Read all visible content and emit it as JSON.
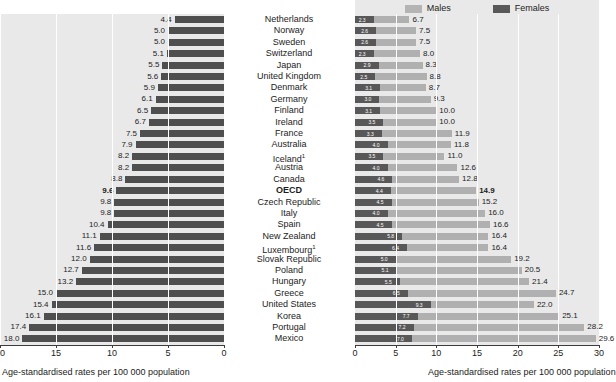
{
  "legend": {
    "items": [
      {
        "label": "Males",
        "color": "#b0b0b0",
        "name": "males"
      },
      {
        "label": "Females",
        "color": "#585858",
        "name": "females"
      }
    ]
  },
  "axis_title_left": "Age-standardised rates per 100 000 population",
  "axis_title_right": "Age-standardised rates per 100 000 population",
  "left_ticks": [
    "20",
    "15",
    "10",
    "5",
    "0"
  ],
  "right_ticks": [
    "0",
    "5",
    "10",
    "15",
    "20",
    "25",
    "30"
  ],
  "chart_data": {
    "type": "bar",
    "title": "",
    "subtitle": "",
    "orientation": "horizontal",
    "panels": [
      {
        "name": "total",
        "xlabel": "Age-standardised rates per 100 000 population",
        "xlim": [
          20,
          0
        ],
        "direction": "right-to-left",
        "ticks": [
          20,
          15,
          10,
          5,
          0
        ],
        "grid": true,
        "series_name": "Total",
        "color": "#4f4f4f"
      },
      {
        "name": "by-sex",
        "xlabel": "Age-standardised rates per 100 000 population",
        "xlim": [
          0,
          30
        ],
        "direction": "left-to-right",
        "ticks": [
          0,
          5,
          10,
          15,
          20,
          25,
          30
        ],
        "grid": true,
        "legend": [
          "Males",
          "Females"
        ],
        "legend_position": "top"
      }
    ],
    "categories": [
      "Netherlands",
      "Norway",
      "Sweden",
      "Switzerland",
      "Japan",
      "United Kingdom",
      "Denmark",
      "Germany",
      "Finland",
      "Ireland",
      "France",
      "Australia",
      "Iceland¹",
      "Austria",
      "Canada",
      "OECD",
      "Czech Republic",
      "Italy",
      "Spain",
      "New Zealand",
      "Luxembourg¹",
      "Slovak Republic",
      "Poland",
      "Hungary",
      "Greece",
      "United States",
      "Korea",
      "Portugal",
      "Mexico"
    ],
    "series": [
      {
        "name": "Total",
        "panel": "total",
        "values": [
          4.4,
          5.0,
          5.0,
          5.1,
          5.5,
          5.6,
          5.9,
          6.1,
          6.5,
          6.7,
          7.5,
          7.9,
          8.2,
          8.2,
          8.8,
          9.6,
          9.8,
          9.8,
          10.4,
          11.1,
          11.6,
          12.0,
          12.7,
          13.2,
          15.0,
          15.4,
          16.1,
          17.4,
          18.0
        ]
      },
      {
        "name": "Males",
        "panel": "by-sex",
        "values": [
          6.7,
          7.5,
          7.5,
          8.0,
          8.3,
          8.8,
          8.7,
          9.3,
          10.0,
          10.0,
          11.9,
          11.8,
          11.0,
          12.6,
          12.8,
          14.9,
          15.2,
          16.0,
          16.6,
          16.4,
          16.4,
          19.2,
          20.5,
          21.4,
          24.7,
          22.0,
          25.1,
          28.2,
          29.6
        ]
      },
      {
        "name": "Females",
        "panel": "by-sex",
        "values": [
          2.3,
          2.6,
          2.6,
          2.3,
          2.9,
          2.5,
          3.1,
          3.0,
          3.1,
          3.5,
          3.3,
          4.0,
          3.5,
          4.0,
          4.6,
          4.4,
          4.5,
          4.0,
          4.5,
          5.8,
          6.4,
          5.0,
          5.1,
          5.5,
          6.5,
          9.3,
          7.7,
          7.2,
          7.0
        ]
      }
    ],
    "rows": [
      {
        "country": "Netherlands",
        "total": "4.4",
        "males": "6.7",
        "females": "2.3",
        "bold": false
      },
      {
        "country": "Norway",
        "total": "5.0",
        "males": "7.5",
        "females": "2.6",
        "bold": false
      },
      {
        "country": "Sweden",
        "total": "5.0",
        "males": "7.5",
        "females": "2.6",
        "bold": false
      },
      {
        "country": "Switzerland",
        "total": "5.1",
        "males": "8.0",
        "females": "2.3",
        "bold": false
      },
      {
        "country": "Japan",
        "total": "5.5",
        "males": "8.3",
        "females": "2.9",
        "bold": false
      },
      {
        "country": "United Kingdom",
        "total": "5.6",
        "males": "8.8",
        "females": "2.5",
        "bold": false
      },
      {
        "country": "Denmark",
        "total": "5.9",
        "males": "8.7",
        "females": "3.1",
        "bold": false
      },
      {
        "country": "Germany",
        "total": "6.1",
        "males": "9.3",
        "females": "3.0",
        "bold": false
      },
      {
        "country": "Finland",
        "total": "6.5",
        "males": "10.0",
        "females": "3.1",
        "bold": false
      },
      {
        "country": "Ireland",
        "total": "6.7",
        "males": "10.0",
        "females": "3.5",
        "bold": false
      },
      {
        "country": "France",
        "total": "7.5",
        "males": "11.9",
        "females": "3.3",
        "bold": false
      },
      {
        "country": "Australia",
        "total": "7.9",
        "males": "11.8",
        "females": "4.0",
        "bold": false
      },
      {
        "country": "Iceland",
        "sup": "1",
        "total": "8.2",
        "males": "11.0",
        "females": "3.5",
        "bold": false
      },
      {
        "country": "Austria",
        "total": "8.2",
        "males": "12.6",
        "females": "4.0",
        "bold": false
      },
      {
        "country": "Canada",
        "total": "8.8",
        "males": "12.8",
        "females": "4.6",
        "bold": false
      },
      {
        "country": "OECD",
        "total": "9.6",
        "males": "14.9",
        "females": "4.4",
        "bold": true
      },
      {
        "country": "Czech Republic",
        "total": "9.8",
        "males": "15.2",
        "females": "4.5",
        "bold": false
      },
      {
        "country": "Italy",
        "total": "9.8",
        "males": "16.0",
        "females": "4.0",
        "bold": false
      },
      {
        "country": "Spain",
        "total": "10.4",
        "males": "16.6",
        "females": "4.5",
        "bold": false
      },
      {
        "country": "New Zealand",
        "total": "11.1",
        "males": "16.4",
        "females": "5.8",
        "bold": false
      },
      {
        "country": "Luxembourg",
        "sup": "1",
        "total": "11.6",
        "males": "16.4",
        "females": "6.4",
        "bold": false
      },
      {
        "country": "Slovak Republic",
        "total": "12.0",
        "males": "19.2",
        "females": "5.0",
        "bold": false
      },
      {
        "country": "Poland",
        "total": "12.7",
        "males": "20.5",
        "females": "5.1",
        "bold": false
      },
      {
        "country": "Hungary",
        "total": "13.2",
        "males": "21.4",
        "females": "5.5",
        "bold": false
      },
      {
        "country": "Greece",
        "total": "15.0",
        "males": "24.7",
        "females": "6.5",
        "bold": false
      },
      {
        "country": "United States",
        "total": "15.4",
        "males": "22.0",
        "females": "9.3",
        "bold": false
      },
      {
        "country": "Korea",
        "total": "16.1",
        "males": "25.1",
        "females": "7.7",
        "bold": false
      },
      {
        "country": "Portugal",
        "total": "17.4",
        "males": "28.2",
        "females": "7.2",
        "bold": false
      },
      {
        "country": "Mexico",
        "total": "18.0",
        "males": "29.6",
        "females": "7.0",
        "bold": false
      }
    ]
  }
}
